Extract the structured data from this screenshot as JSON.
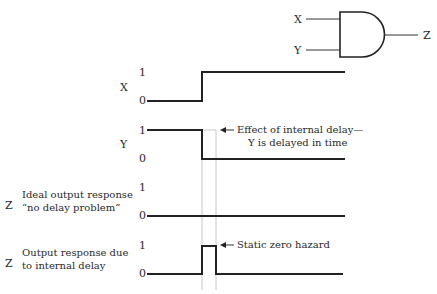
{
  "gate": {
    "type": "AND",
    "inputs": [
      "X",
      "Y"
    ],
    "output": "Z"
  },
  "signals": [
    {
      "name": "X",
      "high_label": "1",
      "low_label": "0",
      "description": ""
    },
    {
      "name": "Y",
      "high_label": "1",
      "low_label": "0",
      "description": ""
    },
    {
      "name": "Z",
      "high_label": "1",
      "low_label": "0",
      "description_line1": "Ideal output response",
      "description_line2": "“no delay problem”"
    },
    {
      "name": "Z",
      "high_label": "1",
      "low_label": "0",
      "description_line1": "Output response due",
      "description_line2": "to internal delay"
    }
  ],
  "annotations": {
    "delay_line1": "Effect of internal delay—",
    "delay_line2": "Y is delayed in time",
    "hazard": "Static zero hazard"
  }
}
